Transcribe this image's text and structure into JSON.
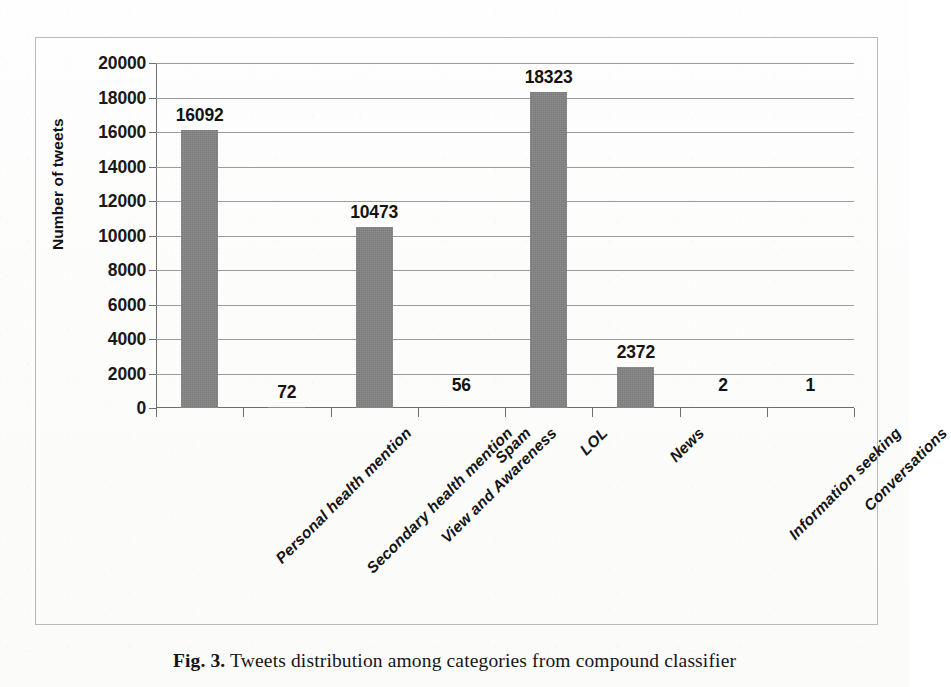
{
  "chart_data": {
    "type": "bar",
    "title": "",
    "xlabel": "",
    "ylabel": "Number of tweets",
    "ylim": [
      0,
      20000
    ],
    "grid": true,
    "legend": "none",
    "categories": [
      "Personal health mention",
      "Secondary health mention",
      "View and Awareness",
      "Spam",
      "LOL",
      "News",
      "Information seeking",
      "Conversations"
    ],
    "values": [
      16092,
      72,
      10473,
      56,
      18323,
      2372,
      2,
      1
    ],
    "value_labels": [
      "16092",
      "72",
      "10473",
      "56",
      "18323",
      "2372",
      "2",
      "1"
    ],
    "ytick_labels": [
      "0",
      "2000",
      "4000",
      "6000",
      "8000",
      "10000",
      "12000",
      "14000",
      "16000",
      "18000",
      "20000"
    ],
    "ytick_values": [
      0,
      2000,
      4000,
      6000,
      8000,
      10000,
      12000,
      14000,
      16000,
      18000,
      20000
    ],
    "bar_color": "#828282",
    "gridline_color": "#9a9a9a",
    "axis_color": "#6e6e6e"
  },
  "caption": {
    "figure_number": "Fig. 3.",
    "text": "Tweets distribution among categories from compound classifier"
  }
}
